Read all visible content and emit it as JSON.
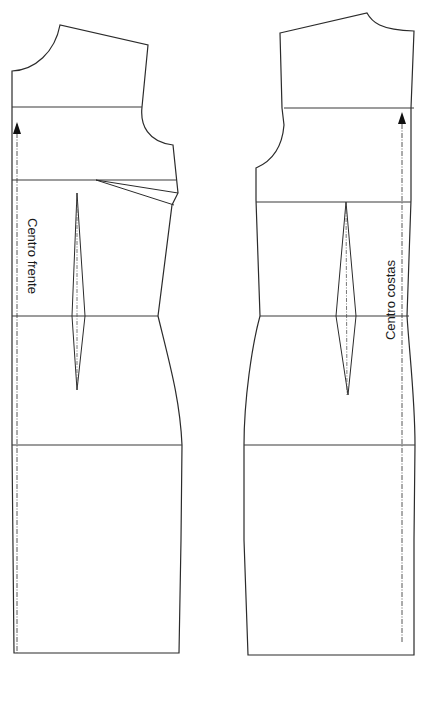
{
  "diagram": {
    "stroke_color": "#2b2b2b",
    "background": "#ffffff"
  },
  "front_piece": {
    "name": "front",
    "label": "Centro frente",
    "outline_path": "M 12 71 C 35 70 55 52 60 25 L 148 45 L 142 107 C 140 125 148 142 173 145 L 178 193 L 172 205 L 158 316 C 170 365 180 400 182 445 L 181 540 L 179 653 L 14 653 L 12 445 Z",
    "lines": [
      {
        "name": "chest-line",
        "x1": 12,
        "y1": 107,
        "x2": 142,
        "y2": 107
      },
      {
        "name": "bust-line",
        "x1": 12,
        "y1": 180,
        "x2": 176,
        "y2": 180
      },
      {
        "name": "waist-line",
        "x1": 12,
        "y1": 316,
        "x2": 158,
        "y2": 316
      },
      {
        "name": "hip-line",
        "x1": 12,
        "y1": 445,
        "x2": 182,
        "y2": 445
      }
    ],
    "side_dart": {
      "path": "M 96 180 L 178 193 M 96 180 L 174 205"
    },
    "waist_dart": {
      "outline": "M 77 193 L 85 316 L 77 390 L 72 316 Z",
      "center": {
        "x1": 77,
        "y1": 193,
        "x2": 77,
        "y2": 390
      }
    },
    "grainline": {
      "x1": 17,
      "y1": 124,
      "x2": 17,
      "y2": 653,
      "arrow_tip_x": 17,
      "arrow_tip_y": 122
    },
    "label_pos": {
      "x": 28,
      "y": 218,
      "rotate": 90
    }
  },
  "back_piece": {
    "name": "back",
    "label": "Centro costas",
    "outline_path": "M 280 33 L 367 13 C 372 22 380 30 414 31 L 411 108 L 411 200 L 407 316 C 410 360 415 400 415 445 L 414 540 L 414 655 L 248 655 L 244 540 L 244 445 C 244 400 252 345 260 316 L 256 200 L 256 168 C 270 162 282 150 284 125 L 282 108 Z",
    "lines": [
      {
        "name": "chest-line",
        "x1": 284,
        "y1": 108,
        "x2": 414,
        "y2": 108
      },
      {
        "name": "bust-line",
        "x1": 256,
        "y1": 202,
        "x2": 411,
        "y2": 202
      },
      {
        "name": "waist-line",
        "x1": 260,
        "y1": 316,
        "x2": 409,
        "y2": 316
      },
      {
        "name": "hip-line",
        "x1": 244,
        "y1": 445,
        "x2": 415,
        "y2": 445
      }
    ],
    "waist_dart": {
      "outline": "M 346 202 L 356 316 L 348 395 L 336 316 Z",
      "center": {
        "x1": 346,
        "y1": 202,
        "x2": 347,
        "y2": 395
      }
    },
    "grainline": {
      "x1": 402,
      "y1": 124,
      "x2": 402,
      "y2": 642,
      "arrow_tip_x": 402,
      "arrow_tip_y": 112
    },
    "label_pos": {
      "x": 395,
      "y": 300,
      "rotate": -90
    }
  }
}
